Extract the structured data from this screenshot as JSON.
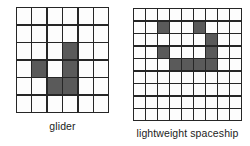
{
  "figure": {
    "background_color": "#ffffff",
    "grid_line_color": "#262626",
    "cell_empty_color": "#fdfdfd",
    "cell_filled_color": "#5a5a5a",
    "panels": [
      {
        "name": "glider",
        "caption": "glider",
        "columns": 6,
        "rows": 6,
        "filled_cells": [
          [
            3,
            4
          ],
          [
            4,
            2
          ],
          [
            4,
            4
          ],
          [
            5,
            3
          ],
          [
            5,
            4
          ]
        ],
        "grid": [
          [
            0,
            0,
            0,
            0,
            0,
            0
          ],
          [
            0,
            0,
            0,
            0,
            0,
            0
          ],
          [
            0,
            0,
            0,
            1,
            0,
            0
          ],
          [
            0,
            1,
            0,
            1,
            0,
            0
          ],
          [
            0,
            0,
            1,
            1,
            0,
            0
          ],
          [
            0,
            0,
            0,
            0,
            0,
            0
          ]
        ]
      },
      {
        "name": "lightweight-spaceship",
        "caption": "lightweight spaceship",
        "columns": 9,
        "rows": 9,
        "filled_cells": [
          [
            2,
            3
          ],
          [
            2,
            6
          ],
          [
            3,
            7
          ],
          [
            4,
            3
          ],
          [
            4,
            7
          ],
          [
            5,
            4
          ],
          [
            5,
            5
          ],
          [
            5,
            6
          ],
          [
            5,
            7
          ]
        ],
        "grid": [
          [
            0,
            0,
            0,
            0,
            0,
            0,
            0,
            0,
            0
          ],
          [
            0,
            0,
            1,
            0,
            0,
            1,
            0,
            0,
            0
          ],
          [
            0,
            0,
            0,
            0,
            0,
            0,
            1,
            0,
            0
          ],
          [
            0,
            0,
            1,
            0,
            0,
            0,
            1,
            0,
            0
          ],
          [
            0,
            0,
            0,
            1,
            1,
            1,
            1,
            0,
            0
          ],
          [
            0,
            0,
            0,
            0,
            0,
            0,
            0,
            0,
            0
          ],
          [
            0,
            0,
            0,
            0,
            0,
            0,
            0,
            0,
            0
          ],
          [
            0,
            0,
            0,
            0,
            0,
            0,
            0,
            0,
            0
          ],
          [
            0,
            0,
            0,
            0,
            0,
            0,
            0,
            0,
            0
          ]
        ]
      }
    ]
  }
}
